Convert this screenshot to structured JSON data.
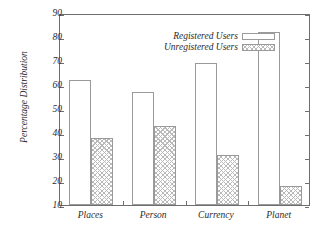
{
  "chart_data": {
    "type": "bar",
    "title": "",
    "subtitle": "",
    "xlabel": "",
    "ylabel": "Percentage Distribution",
    "categories": [
      "Places",
      "Person",
      "Currency",
      "Planet"
    ],
    "series": [
      {
        "name": "Registered Users",
        "values": [
          62,
          57,
          69,
          82
        ],
        "fill": "empty",
        "color": "#ffffff"
      },
      {
        "name": "Unregistered Users",
        "values": [
          38,
          43,
          31,
          18
        ],
        "fill": "crosshatch",
        "color": "#b9b9b9"
      }
    ],
    "ylim": [
      10,
      90
    ],
    "yticks": [
      10,
      20,
      30,
      40,
      50,
      60,
      70,
      80,
      90
    ],
    "ytick_labels": [
      "10",
      "20",
      "30",
      "40",
      "50",
      "60",
      "70",
      "80",
      "90"
    ],
    "grid": false,
    "legend_position": "top-center",
    "axis_color": "#6e6e6e",
    "bar_edge_color": "#9a9a9a",
    "text_color": "#2b2b2b",
    "background": "#ffffff"
  }
}
